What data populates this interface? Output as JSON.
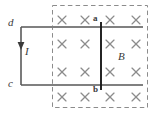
{
  "figure": {
    "canvas": {
      "width": 158,
      "height": 118,
      "background": "#ffffff"
    },
    "colors": {
      "rail": "#808080",
      "rod": "#1a1a1a",
      "lead": "#5a5a5a",
      "field_cross": "#8c8c8c",
      "dashed_border": "#8c8c8c",
      "label": "#3a3a3a"
    },
    "labels": {
      "d": "d",
      "c": "c",
      "current": "I",
      "field": "B",
      "rod_top": "a",
      "rod_bottom": "b"
    },
    "field_region": {
      "name": "magnetic-field-region",
      "direction": "into-page",
      "symbol": "×",
      "x": 52,
      "y": 5,
      "width": 96,
      "height": 103,
      "border_style": "dashed",
      "cross_columns_x": [
        62,
        85,
        110,
        136
      ],
      "cross_rows_y": [
        20,
        44,
        72,
        97
      ],
      "crosses": [
        {
          "x": 62,
          "y": 20
        },
        {
          "x": 85,
          "y": 20
        },
        {
          "x": 110,
          "y": 20
        },
        {
          "x": 136,
          "y": 20
        },
        {
          "x": 62,
          "y": 44
        },
        {
          "x": 85,
          "y": 44
        },
        {
          "x": 110,
          "y": 44
        },
        {
          "x": 136,
          "y": 44
        },
        {
          "x": 62,
          "y": 72
        },
        {
          "x": 85,
          "y": 72
        },
        {
          "x": 110,
          "y": 72
        },
        {
          "x": 136,
          "y": 72
        },
        {
          "x": 62,
          "y": 97
        },
        {
          "x": 85,
          "y": 97
        },
        {
          "x": 110,
          "y": 97
        },
        {
          "x": 136,
          "y": 97
        }
      ]
    },
    "rails": {
      "top": {
        "name": "top-rail",
        "x1": 21,
        "y1": 27,
        "x2": 143,
        "y2": 27
      },
      "bottom": {
        "name": "bottom-rail",
        "x1": 21,
        "y1": 85,
        "x2": 143,
        "y2": 85
      }
    },
    "lead_wire": {
      "name": "left-lead-wire",
      "x1": 21,
      "y1": 27,
      "x2": 21,
      "y2": 85
    },
    "current_arrow": {
      "name": "current-arrow",
      "direction": "down",
      "tip_x": 21,
      "tip_y": 50,
      "label": "I"
    },
    "rod": {
      "name": "sliding-rod",
      "x": 101,
      "y_top": 22,
      "y_bottom": 90,
      "endpoints": [
        "a",
        "b"
      ]
    }
  }
}
